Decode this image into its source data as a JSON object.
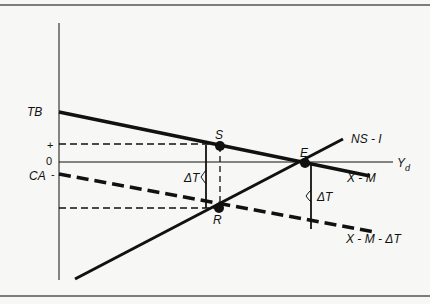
{
  "diagram": {
    "type": "economics-diagram",
    "axis": {
      "y_axis_labels": {
        "tb": "TB",
        "plus": "+",
        "zero": "0",
        "ca": "CA",
        "minus": "-"
      },
      "x_axis_label": "Y",
      "x_axis_subscript": "d"
    },
    "lines": {
      "x_minus_m": "X - M",
      "x_minus_m_minus_dt": "X - M - ΔT",
      "ns_minus_i": "NS - I"
    },
    "points": {
      "s": "S",
      "e": "E",
      "r": "R"
    },
    "brackets": {
      "left": "ΔT",
      "right": "ΔT"
    },
    "colors": {
      "ink": "#111111",
      "background": "#f7f7f5",
      "frame": "#555555"
    }
  }
}
